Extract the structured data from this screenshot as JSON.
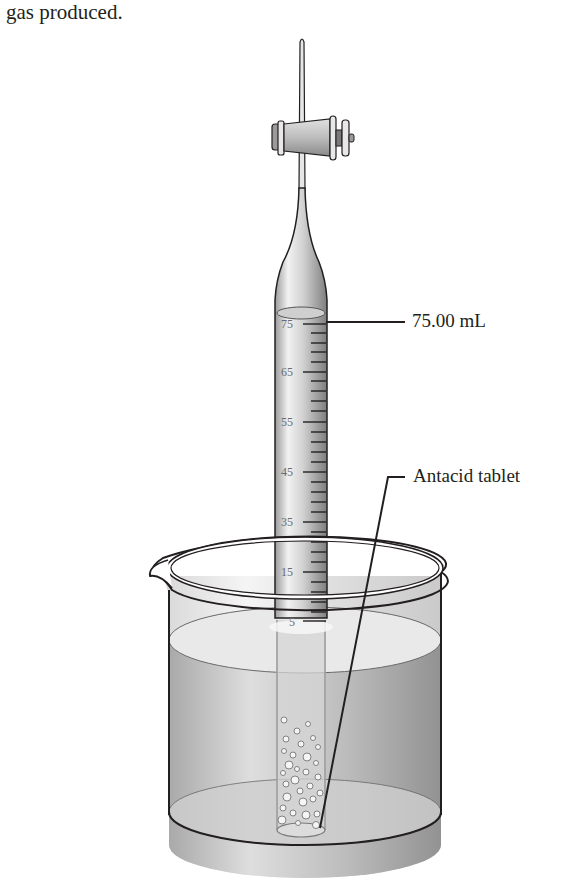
{
  "caption": "gas produced.",
  "labels": {
    "volume": "75.00 mL",
    "tablet": "Antacid tablet"
  },
  "buret": {
    "scale_labels": [
      "75",
      "65",
      "55",
      "45",
      "35",
      "15",
      "5"
    ],
    "reading_ml": 75.0
  },
  "colors": {
    "outline": "#231f20",
    "glass": "#c8c8c8",
    "water": "#bdbdbd",
    "background": "#ffffff"
  }
}
